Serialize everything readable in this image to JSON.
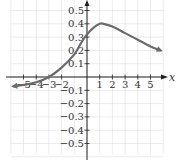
{
  "chart_data": {
    "type": "line",
    "title": "",
    "xlabel": "x",
    "ylabel": "",
    "xlim": [
      -6,
      6
    ],
    "ylim": [
      -0.55,
      0.55
    ],
    "grid": true,
    "legend": null,
    "x_ticks": [
      -5,
      -4,
      -3,
      -2,
      1,
      2,
      3,
      4,
      5
    ],
    "x_tick_labels": [
      "-5",
      "-4",
      "-3",
      "-2",
      "1",
      "2",
      "3",
      "4",
      "5"
    ],
    "y_ticks": [
      0.5,
      0.4,
      0.3,
      0.2,
      0.1,
      -0.1,
      -0.2,
      -0.3,
      -0.4,
      -0.5
    ],
    "y_tick_labels": [
      "0.5",
      "0.4",
      "0.3",
      "0.2",
      "0.1",
      "-0.1",
      "-0.2",
      "-0.3",
      "-0.4",
      "-0.5"
    ],
    "series": [
      {
        "name": "f(x)",
        "color": "#6b6b6b",
        "arrows": "both",
        "x": [
          -5.8,
          -5,
          -4,
          -3,
          -2,
          -1,
          -0.5,
          0,
          0.5,
          1,
          1.3,
          2,
          3,
          4,
          5,
          5.8
        ],
        "y": [
          -0.07,
          -0.06,
          -0.04,
          0.0,
          0.07,
          0.17,
          0.25,
          0.32,
          0.37,
          0.4,
          0.4,
          0.38,
          0.33,
          0.28,
          0.23,
          0.2
        ]
      }
    ]
  },
  "colors": {
    "grid": "#dddddd",
    "axis": "#222222",
    "curve": "#6b6b6b"
  }
}
